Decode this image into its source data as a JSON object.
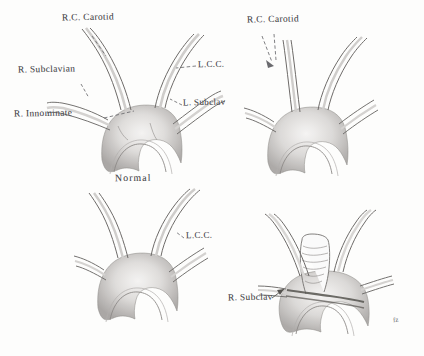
{
  "figure": {
    "caption": "Normal",
    "ink_color": "#5b5b60",
    "paper_color": "#fdfdfc",
    "panels": [
      {
        "id": "top-left",
        "name": "normal-arch",
        "caption": "Normal",
        "labels": [
          {
            "key": "rcc",
            "text": "R.C. Carotid"
          },
          {
            "key": "rsub",
            "text": "R. Subclavian"
          },
          {
            "key": "rinn",
            "text": "R. Innominate"
          },
          {
            "key": "lcc",
            "text": "L.C.C."
          },
          {
            "key": "lsub",
            "text": "L. Subclav"
          }
        ]
      },
      {
        "id": "top-right",
        "name": "variant-arch-1",
        "caption": "",
        "labels": [
          {
            "key": "rcc",
            "text": "R.C. Carotid"
          }
        ]
      },
      {
        "id": "bottom-left",
        "name": "variant-arch-2",
        "caption": "",
        "labels": [
          {
            "key": "lcc",
            "text": "L.C.C."
          }
        ]
      },
      {
        "id": "bottom-right",
        "name": "variant-arch-3-with-trachea",
        "caption": "",
        "labels": [
          {
            "key": "rsub",
            "text": "R. Subclav"
          }
        ]
      }
    ],
    "signature": "fz"
  },
  "labels": {
    "rc_carotid_tl": "R.C. Carotid",
    "r_subclavian_tl": "R. Subclavian",
    "r_innominate_tl": "R. Innominate",
    "lcc_tl": "L.C.C.",
    "l_subclav_tl": "L. Subclav",
    "caption_normal": "Normal",
    "rc_carotid_tr": "R.C. Carotid",
    "lcc_bl": "L.C.C.",
    "r_subclav_br": "R. Subclav",
    "signature": "fz"
  }
}
